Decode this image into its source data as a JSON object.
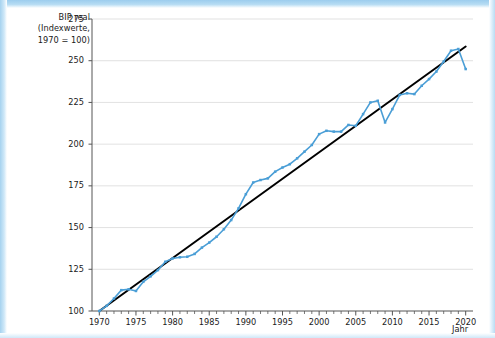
{
  "figure": {
    "background_color": "#ffffff",
    "page_bleed_color": "#a9d4ee"
  },
  "axes": {
    "y_title": "BIP real\n(Indexwerte,\n1970 = 100)",
    "x_title": "Jahr",
    "y_ticks": [
      "100",
      "125",
      "150",
      "175",
      "200",
      "225",
      "250",
      "275"
    ],
    "x_ticks": [
      "1970",
      "1975",
      "1980",
      "1985",
      "1990",
      "1995",
      "2000",
      "2005",
      "2010",
      "2015",
      "2020"
    ]
  },
  "chart_data": {
    "type": "line",
    "title": "",
    "subtitle": "",
    "xlabel": "Jahr",
    "ylabel": "BIP real (Indexwerte, 1970 = 100)",
    "xlim": [
      1969,
      2021
    ],
    "ylim": [
      100,
      275
    ],
    "xticks": [
      1970,
      1975,
      1980,
      1985,
      1990,
      1995,
      2000,
      2005,
      2010,
      2015,
      2020
    ],
    "yticks": [
      100,
      125,
      150,
      175,
      200,
      225,
      250,
      275
    ],
    "minor_xticks_every": 1,
    "grid": "horizontal",
    "grid_color": "#d9d9d9",
    "legend": null,
    "x": [
      1970,
      1971,
      1972,
      1973,
      1974,
      1975,
      1976,
      1977,
      1978,
      1979,
      1980,
      1981,
      1982,
      1983,
      1984,
      1985,
      1986,
      1987,
      1988,
      1989,
      1990,
      1991,
      1992,
      1993,
      1994,
      1995,
      1996,
      1997,
      1998,
      1999,
      2000,
      2001,
      2002,
      2003,
      2004,
      2005,
      2006,
      2007,
      2008,
      2009,
      2010,
      2011,
      2012,
      2013,
      2014,
      2015,
      2016,
      2017,
      2018,
      2019,
      2020
    ],
    "series": [
      {
        "name": "BIP real (Indexwerte, 1970 = 100)",
        "color": "#4a9ed6",
        "marker": "square",
        "linewidth": 1.6,
        "values": [
          100.0,
          103.1,
          107.5,
          112.5,
          113.0,
          112.0,
          117.5,
          120.8,
          124.5,
          129.5,
          131.5,
          132.2,
          132.5,
          134.2,
          138.0,
          141.0,
          144.5,
          149.0,
          154.5,
          161.5,
          170.0,
          177.0,
          178.5,
          179.5,
          183.5,
          186.0,
          188.0,
          191.5,
          195.5,
          199.5,
          206.0,
          208.0,
          207.5,
          207.5,
          211.5,
          211.0,
          218.0,
          225.0,
          226.0,
          213.0,
          221.0,
          229.5,
          230.5,
          230.0,
          235.0,
          239.0,
          243.5,
          249.5,
          256.0,
          257.0,
          245.0
        ]
      },
      {
        "name": "Trendgerade",
        "color": "#000000",
        "marker": "none",
        "linewidth": 2.0,
        "trend": true,
        "endpoints": [
          [
            1970,
            100.0
          ],
          [
            2020,
            258.5
          ]
        ]
      }
    ]
  }
}
